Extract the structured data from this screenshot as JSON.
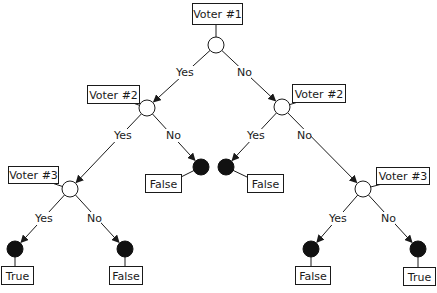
{
  "colors": {
    "line": "#1a1a1a",
    "leaf_fill": "#111111",
    "background": "#ffffff"
  },
  "decision_nodes": [
    {
      "id": "v1",
      "label": "Voter #1",
      "cx": 216,
      "cy": 45,
      "r": 8,
      "box": {
        "x": 192,
        "y": 3,
        "w": 50,
        "h": 21
      }
    },
    {
      "id": "v2l",
      "label": "Voter #2",
      "cx": 147,
      "cy": 108,
      "r": 8,
      "box": {
        "x": 87,
        "y": 85,
        "w": 52,
        "h": 18
      }
    },
    {
      "id": "v2r",
      "label": "Voter #2",
      "cx": 282,
      "cy": 107,
      "r": 8,
      "box": {
        "x": 292,
        "y": 84,
        "w": 53,
        "h": 18
      }
    },
    {
      "id": "v3l",
      "label": "Voter #3",
      "cx": 70,
      "cy": 189,
      "r": 8,
      "box": {
        "x": 8,
        "y": 166,
        "w": 50,
        "h": 17
      }
    },
    {
      "id": "v3r",
      "label": "Voter #3",
      "cx": 363,
      "cy": 189,
      "r": 8,
      "box": {
        "x": 376,
        "y": 167,
        "w": 53,
        "h": 17
      }
    }
  ],
  "leaf_nodes": [
    {
      "id": "l1",
      "label": "False",
      "cx": 201,
      "cy": 167,
      "r": 8,
      "box": {
        "x": 145,
        "y": 174,
        "w": 36,
        "h": 18
      }
    },
    {
      "id": "l2",
      "label": "False",
      "cx": 226,
      "cy": 167,
      "r": 8,
      "box": {
        "x": 247,
        "y": 174,
        "w": 36,
        "h": 18
      }
    },
    {
      "id": "l3",
      "label": "True",
      "cx": 15,
      "cy": 249,
      "r": 8,
      "box": {
        "x": 1,
        "y": 266,
        "w": 32,
        "h": 18
      }
    },
    {
      "id": "l4",
      "label": "False",
      "cx": 125,
      "cy": 249,
      "r": 8,
      "box": {
        "x": 109,
        "y": 266,
        "w": 33,
        "h": 18
      }
    },
    {
      "id": "l5",
      "label": "False",
      "cx": 311,
      "cy": 249,
      "r": 8,
      "box": {
        "x": 295,
        "y": 266,
        "w": 35,
        "h": 18
      }
    },
    {
      "id": "l6",
      "label": "True",
      "cx": 418,
      "cy": 249,
      "r": 8,
      "box": {
        "x": 403,
        "y": 267,
        "w": 32,
        "h": 18
      }
    }
  ],
  "edges": [
    {
      "from": "v1",
      "to": "v2l",
      "label": "Yes",
      "lx": 176,
      "ly": 76
    },
    {
      "from": "v1",
      "to": "v2r",
      "label": "No",
      "lx": 237,
      "ly": 76
    },
    {
      "from": "v2l",
      "to": "v3l",
      "label": "Yes",
      "lx": 114,
      "ly": 139
    },
    {
      "from": "v2l",
      "to": "l1",
      "label": "No",
      "lx": 166,
      "ly": 139
    },
    {
      "from": "v2r",
      "to": "l2",
      "label": "Yes",
      "lx": 247,
      "ly": 139
    },
    {
      "from": "v2r",
      "to": "v3r",
      "label": "No",
      "lx": 297,
      "ly": 139
    },
    {
      "from": "v3l",
      "to": "l3",
      "label": "Yes",
      "lx": 35,
      "ly": 222
    },
    {
      "from": "v3l",
      "to": "l4",
      "label": "No",
      "lx": 87,
      "ly": 222
    },
    {
      "from": "v3r",
      "to": "l5",
      "label": "Yes",
      "lx": 329,
      "ly": 222
    },
    {
      "from": "v3r",
      "to": "l6",
      "label": "No",
      "lx": 381,
      "ly": 222
    }
  ]
}
